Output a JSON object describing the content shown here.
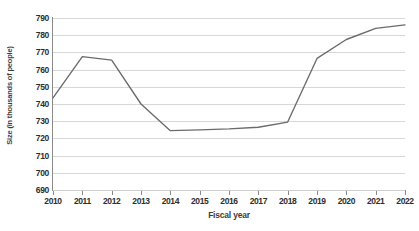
{
  "chart_data": {
    "type": "line",
    "title": "",
    "subtitle": "",
    "xlabel": "Fiscal year",
    "ylabel": "Size (in thousands of people)",
    "x": [
      2010,
      2011,
      2012,
      2013,
      2014,
      2015,
      2016,
      2017,
      2018,
      2019,
      2020,
      2021,
      2022
    ],
    "categories": [
      "2010",
      "2011",
      "2012",
      "2013",
      "2014",
      "2015",
      "2016",
      "2017",
      "2018",
      "2019",
      "2020",
      "2021",
      "2022"
    ],
    "series": [
      {
        "name": "Size",
        "color": "#6b6b6b",
        "values": [
          743.5,
          767.5,
          765.5,
          740.0,
          724.5,
          725.0,
          725.5,
          726.5,
          729.5,
          766.5,
          777.5,
          784.0,
          786.0
        ]
      }
    ],
    "values": [
      743.5,
      767.5,
      765.5,
      740.0,
      724.5,
      725.0,
      725.5,
      726.5,
      729.5,
      766.5,
      777.5,
      784.0,
      786.0
    ],
    "ylim": [
      690,
      790
    ],
    "xlim": [
      2010,
      2022
    ],
    "y_ticks": [
      690,
      700,
      710,
      720,
      730,
      740,
      750,
      760,
      770,
      780,
      790
    ],
    "y_tick_labels": [
      "690",
      "700",
      "710",
      "720",
      "730",
      "740",
      "750",
      "760",
      "770",
      "780",
      "790"
    ],
    "x_tick_labels": [
      "2010",
      "2011",
      "2012",
      "2013",
      "2014",
      "2015",
      "2016",
      "2017",
      "2018",
      "2019",
      "2020",
      "2021",
      "2022"
    ],
    "grid": "horizontal",
    "gridline_color": "#d8d8d8",
    "legend": "none",
    "legend_position": "none",
    "background_color": "#ffffff",
    "axis_color": "#8a8a8a",
    "markers": "none",
    "annotations": []
  }
}
